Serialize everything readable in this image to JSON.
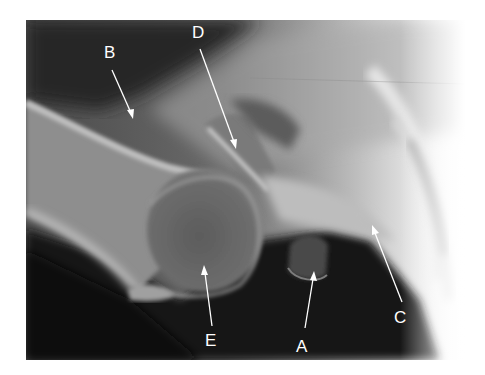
{
  "figure": {
    "type": "shoulder radiograph (axillary view)",
    "labels": [
      {
        "id": "A",
        "text": "A",
        "x": 302,
        "y": 352
      },
      {
        "id": "B",
        "text": "B",
        "x": 111,
        "y": 58
      },
      {
        "id": "C",
        "text": "C",
        "x": 400,
        "y": 323
      },
      {
        "id": "D",
        "text": "D",
        "x": 199,
        "y": 38
      },
      {
        "id": "E",
        "text": "E",
        "x": 211,
        "y": 346
      }
    ]
  }
}
